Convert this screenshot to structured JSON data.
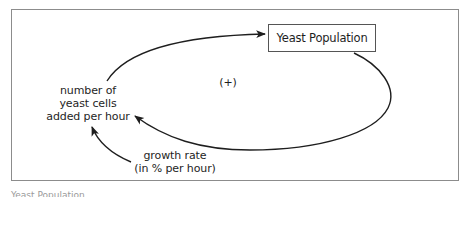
{
  "diagram": {
    "type": "causal-loop",
    "stock": {
      "label": "Yeast Population"
    },
    "flow": {
      "lines": [
        "number of",
        "yeast cells",
        "added per hour"
      ]
    },
    "parameter": {
      "lines": [
        "growth rate",
        "(in % per hour)"
      ]
    },
    "loop_polarity": "(+)",
    "links": [
      {
        "from": "number of yeast cells added per hour",
        "to": "Yeast Population"
      },
      {
        "from": "Yeast Population",
        "to": "number of yeast cells added per hour"
      },
      {
        "from": "growth rate (in % per hour)",
        "to": "number of yeast cells added per hour"
      }
    ],
    "colors": {
      "line": "#1e1e1e",
      "frame": "#8c8c8c",
      "background": "#ffffff"
    }
  },
  "caption": {
    "text": "Yeast Population"
  }
}
